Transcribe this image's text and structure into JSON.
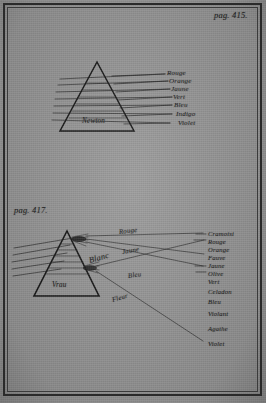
{
  "plate": {
    "background_color": "#9a9a9a",
    "ink_color": "#1e1e1e"
  },
  "top_figure": {
    "page_label": "pag. 415.",
    "prism_label": "Newton",
    "spectrum_labels": [
      "Rouge",
      "Orange",
      "Jaune",
      "Vert",
      "Bleu",
      "Indigo",
      "Violet"
    ]
  },
  "bottom_figure": {
    "page_label": "pag. 417.",
    "prism_label": "Vrau",
    "ray_labels": [
      "Rouge",
      "Jaune",
      "Blanc",
      "Bleu",
      "Fleur"
    ],
    "color_list": [
      "Cramoisi",
      "Rouge",
      "Orange",
      "Fauve",
      "Jaune",
      "Olive",
      "Vert",
      "Celadon",
      "Bleu",
      "Violant",
      "Agathe",
      "Violet"
    ]
  }
}
